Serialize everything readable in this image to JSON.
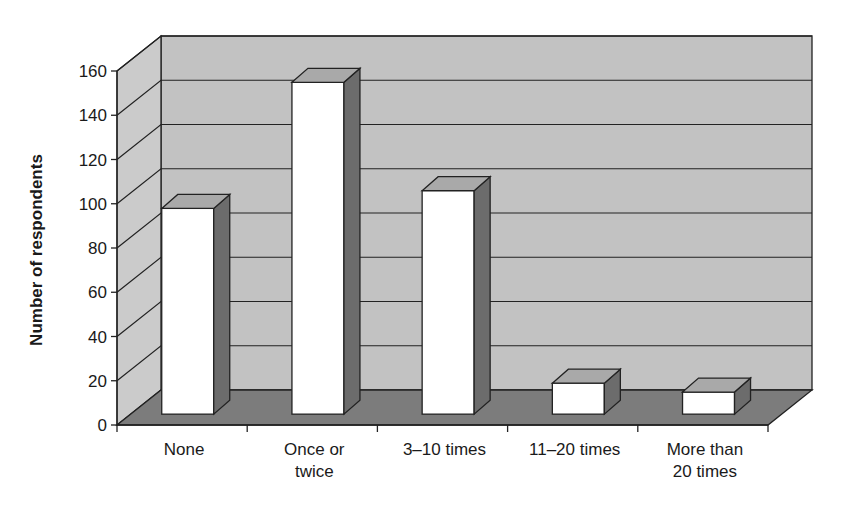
{
  "chart_data": {
    "type": "bar",
    "style": "3d-column",
    "title": "",
    "xlabel": "",
    "ylabel": "Number of respondents",
    "categories": [
      "None",
      "Once or twice",
      "3–10 times",
      "11–20 times",
      "More than 20 times"
    ],
    "category_lines": [
      [
        "None"
      ],
      [
        "Once or",
        "twice"
      ],
      [
        "3–10 times"
      ],
      [
        "11–20 times"
      ],
      [
        "More than",
        "20 times"
      ]
    ],
    "values": [
      93,
      150,
      101,
      14,
      10
    ],
    "ylim": [
      0,
      160
    ],
    "yticks": [
      0,
      20,
      40,
      60,
      80,
      100,
      120,
      140,
      160
    ],
    "grid": true,
    "legend": "none"
  },
  "colors": {
    "back_wall": "#c2c2c2",
    "side_wall": "#cbcbcb",
    "floor": "#7c7c7c",
    "bar_front": "#ffffff",
    "bar_top": "#a9a9a9",
    "bar_side": "#6c6c6c",
    "line": "#222222"
  }
}
